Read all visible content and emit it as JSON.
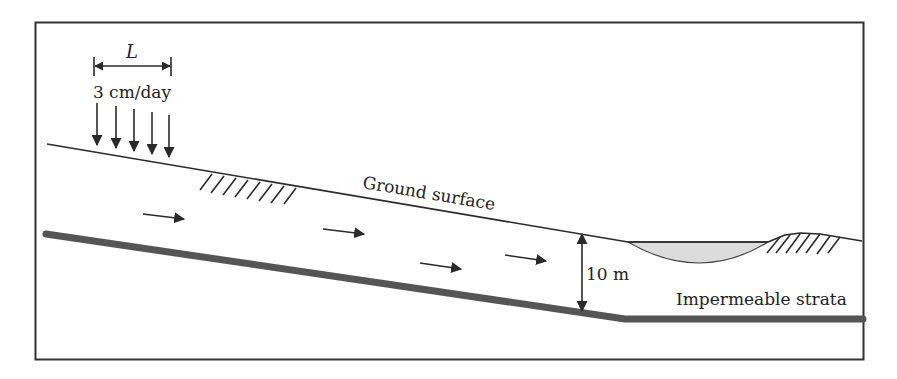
{
  "diagram": {
    "type": "cross-section",
    "labels": {
      "recharge_length": "L",
      "recharge_rate": "3 cm/day",
      "ground_surface": "Ground surface",
      "thickness": "10 m",
      "impermeable": "Impermeable strata"
    },
    "recharge_arrow_count": 5,
    "flow_arrow_count": 5,
    "colors": {
      "line": "#2a2a2a",
      "strata": "#555555",
      "pond_fill": "#dcdcdc",
      "frame": "#333333",
      "background": "#ffffff"
    }
  }
}
